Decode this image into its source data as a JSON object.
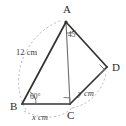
{
  "figure": {
    "kind": "geometry-diagram",
    "background_color": "#ffffff",
    "line_color": "#33322f",
    "guide_color": "#b9b7b4",
    "text_color": "#3a3a3a"
  },
  "vertices": [
    {
      "id": "A",
      "label": "A",
      "x": 66,
      "y": 22
    },
    {
      "id": "B",
      "label": "B",
      "x": 22,
      "y": 104
    },
    {
      "id": "C",
      "label": "C",
      "x": 70,
      "y": 104
    },
    {
      "id": "D",
      "label": "D",
      "x": 107,
      "y": 67
    }
  ],
  "vertex_label_positions": [
    {
      "id": "A",
      "label": "A",
      "x": 63,
      "y": 13
    },
    {
      "id": "B",
      "label": "B",
      "x": 10,
      "y": 110
    },
    {
      "id": "C",
      "label": "C",
      "x": 67,
      "y": 119
    },
    {
      "id": "D",
      "label": "D",
      "x": 112,
      "y": 71
    }
  ],
  "segments": [
    {
      "name": "AB",
      "from": "A",
      "to": "B",
      "style": "solid"
    },
    {
      "name": "BC",
      "from": "B",
      "to": "C",
      "style": "solid"
    },
    {
      "name": "AC",
      "from": "A",
      "to": "C",
      "style": "thin"
    },
    {
      "name": "AD",
      "from": "A",
      "to": "D",
      "style": "solid"
    },
    {
      "name": "CD",
      "from": "C",
      "to": "D",
      "style": "solid"
    }
  ],
  "measures": [
    {
      "name": "side-ab-length",
      "text": "12 cm",
      "italic": false,
      "x": 16,
      "y": 55,
      "rotate": 0,
      "refers_to": "AB"
    },
    {
      "name": "side-bc-length",
      "text": "x cm",
      "italic": true,
      "x": 32,
      "y": 120,
      "rotate": 0,
      "refers_to": "BC"
    },
    {
      "name": "side-cd-length",
      "text": "y cm",
      "italic": true,
      "x": 78,
      "y": 96,
      "rotate": 0,
      "refers_to": "CD"
    }
  ],
  "angles": [
    {
      "name": "angle-at-b",
      "text": "60°",
      "value": 60,
      "vertex": "B",
      "x": 30,
      "y": 99,
      "marker": "arc"
    },
    {
      "name": "angle-at-a",
      "text": "45",
      "value": 45,
      "vertex": "A",
      "x": 68,
      "y": 37,
      "marker": "arc"
    },
    {
      "name": "right-angle-at-c",
      "text": "",
      "value": 90,
      "vertex": "C",
      "marker": "square"
    },
    {
      "name": "right-angle-at-d",
      "text": "",
      "value": 90,
      "vertex": "D",
      "marker": "square"
    }
  ],
  "guide_arcs": [
    {
      "name": "arc-left-dashed",
      "d": "M 26 110 C 8 78 24 34 62 20"
    },
    {
      "name": "arc-bottom-dashed",
      "d": "M 24 111 C 44 121 62 118 72 108"
    },
    {
      "name": "arc-right-dashed",
      "d": "M 72 108 C 92 104 104 88 106 72"
    }
  ]
}
